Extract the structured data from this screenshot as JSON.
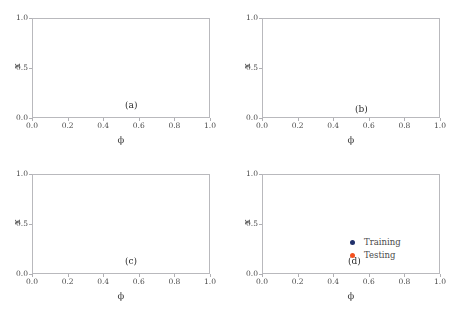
{
  "figure": {
    "background": "#ffffff",
    "axis_color": "#b9b9bd",
    "text_color": "#4a4a4a"
  },
  "legend": {
    "position": "panel-d-lower-right",
    "entries": [
      {
        "label": "Training",
        "color": "#20306b",
        "marker": "circle"
      },
      {
        "label": "Testing",
        "color": "#f4511e",
        "marker": "circle"
      }
    ]
  },
  "axes_common": {
    "xlabel": "ϕ",
    "ylabel": "x",
    "xticks": [
      "0.0",
      "0.2",
      "0.4",
      "0.6",
      "0.8",
      "1.0"
    ],
    "xtick_values": [
      0.0,
      0.2,
      0.4,
      0.6,
      0.8,
      1.0
    ],
    "yticks": [
      "0.0",
      "0.5",
      "1.0"
    ],
    "ytick_values": [
      0.0,
      0.5,
      1.0
    ],
    "xlim": [
      0.0,
      1.0
    ],
    "ylim": [
      0.0,
      1.0
    ],
    "grid": false
  },
  "chart_data": [
    {
      "type": "scatter",
      "panel": "(a)",
      "title": "",
      "xlabel": "ϕ",
      "ylabel": "x",
      "xlim": [
        0.0,
        1.0
      ],
      "ylim": [
        0.0,
        1.0
      ],
      "grid": false,
      "description": "Chaotic band bounded above by a gently undulating ceiling near x=0.87 and below by a wavy floor oscillating between x=0.17 and x=0.47, with embedded lighter voids (islands) arranged in diagonal streaks.",
      "series": [
        {
          "name": "Training",
          "color": "#20306b",
          "n_points": 9000,
          "marker_size": 0.85
        },
        {
          "name": "Testing",
          "color": "#f4511e",
          "n_points": 9000,
          "marker_size": 0.85
        }
      ],
      "band": {
        "upper": [
          0.86,
          0.87,
          0.88,
          0.885,
          0.88,
          0.87,
          0.865,
          0.87,
          0.875,
          0.88,
          0.875,
          0.865,
          0.86,
          0.858,
          0.862,
          0.868,
          0.872,
          0.87,
          0.866,
          0.862,
          0.86
        ],
        "lower": [
          0.31,
          0.285,
          0.26,
          0.235,
          0.215,
          0.205,
          0.205,
          0.22,
          0.255,
          0.3,
          0.345,
          0.39,
          0.425,
          0.452,
          0.468,
          0.47,
          0.455,
          0.425,
          0.385,
          0.345,
          0.31
        ]
      },
      "voids": [
        {
          "cx": 0.1,
          "cy": 0.6,
          "rx": 0.045,
          "ry": 0.17,
          "tilt": -0.22
        },
        {
          "cx": 0.21,
          "cy": 0.61,
          "rx": 0.04,
          "ry": 0.16,
          "tilt": -0.22
        },
        {
          "cx": 0.33,
          "cy": 0.63,
          "rx": 0.04,
          "ry": 0.15,
          "tilt": -0.2
        },
        {
          "cx": 0.45,
          "cy": 0.66,
          "rx": 0.036,
          "ry": 0.13,
          "tilt": -0.18
        },
        {
          "cx": 0.57,
          "cy": 0.68,
          "rx": 0.034,
          "ry": 0.12,
          "tilt": -0.15
        },
        {
          "cx": 0.69,
          "cy": 0.7,
          "rx": 0.03,
          "ry": 0.1,
          "tilt": -0.12
        },
        {
          "cx": 0.8,
          "cy": 0.71,
          "rx": 0.028,
          "ry": 0.09,
          "tilt": -0.1
        },
        {
          "cx": 0.91,
          "cy": 0.7,
          "rx": 0.03,
          "ry": 0.1,
          "tilt": -0.12
        }
      ]
    },
    {
      "type": "scatter",
      "panel": "(b)",
      "title": "",
      "xlabel": "ϕ",
      "ylabel": "x",
      "xlim": [
        0.0,
        1.0
      ],
      "ylim": [
        0.0,
        1.0
      ],
      "grid": false,
      "description": "Large chaotic sea filling almost the entire unit square, capped at x=0.97 and floored by scalloped arcs dipping to x=0.04; contains a large lighter island centered near (0.27,0.42) and a smaller one near (0.83,0.13).",
      "series": [
        {
          "name": "Training",
          "color": "#20306b",
          "n_points": 14000,
          "marker_size": 0.8
        },
        {
          "name": "Testing",
          "color": "#f4511e",
          "n_points": 14000,
          "marker_size": 0.8
        }
      ],
      "band": {
        "upper": [
          0.965,
          0.968,
          0.97,
          0.972,
          0.973,
          0.972,
          0.97,
          0.968,
          0.966,
          0.965,
          0.966,
          0.968,
          0.97,
          0.972,
          0.973,
          0.972,
          0.97,
          0.968,
          0.966,
          0.965,
          0.965
        ],
        "lower": [
          0.115,
          0.095,
          0.085,
          0.09,
          0.105,
          0.125,
          0.135,
          0.13,
          0.11,
          0.075,
          0.045,
          0.055,
          0.095,
          0.135,
          0.155,
          0.15,
          0.125,
          0.09,
          0.06,
          0.055,
          0.085
        ]
      },
      "voids": [
        {
          "cx": 0.275,
          "cy": 0.42,
          "rx": 0.135,
          "ry": 0.155,
          "tilt": 0.1
        },
        {
          "cx": 0.835,
          "cy": 0.135,
          "rx": 0.085,
          "ry": 0.075,
          "tilt": 0.0
        },
        {
          "cx": 0.49,
          "cy": 0.055,
          "rx": 0.03,
          "ry": 0.03,
          "tilt": 0.0
        }
      ]
    },
    {
      "type": "scatter",
      "panel": "(c)",
      "title": "",
      "xlabel": "ϕ",
      "ylabel": "x",
      "xlim": [
        0.0,
        1.0
      ],
      "ylim": [
        0.0,
        1.0
      ],
      "grid": false,
      "description": "Narrow sawtooth filament band with deep V-shaped troughs reaching x=0.02 near phi=0.10, 0.23, 0.47, 0.72 and 0.86, and a tall sharp peak reaching x=1.0 near phi=0.58-0.62.",
      "series": [
        {
          "name": "Training",
          "color": "#20306b",
          "n_points": 7000,
          "marker_size": 0.8
        },
        {
          "name": "Testing",
          "color": "#f4511e",
          "n_points": 7000,
          "marker_size": 0.8
        }
      ],
      "curve": [
        0.52,
        0.53,
        0.5,
        0.22,
        0.06,
        0.33,
        0.5,
        0.5,
        0.28,
        0.05,
        0.07,
        0.45,
        0.68,
        0.72,
        0.55,
        0.3,
        0.06,
        0.4,
        0.78,
        0.95,
        1.0,
        0.96,
        0.7,
        0.4,
        0.14,
        0.05,
        0.22,
        0.45,
        0.55,
        0.4,
        0.12,
        0.03,
        0.18,
        0.45,
        0.62,
        0.66,
        0.6,
        0.52,
        0.48,
        0.5,
        0.55
      ],
      "thickness": [
        0.1,
        0.1,
        0.1,
        0.09,
        0.08,
        0.09,
        0.1,
        0.1,
        0.09,
        0.07,
        0.07,
        0.09,
        0.1,
        0.1,
        0.1,
        0.09,
        0.07,
        0.09,
        0.1,
        0.1,
        0.1,
        0.1,
        0.1,
        0.09,
        0.08,
        0.07,
        0.09,
        0.1,
        0.1,
        0.09,
        0.08,
        0.06,
        0.08,
        0.1,
        0.1,
        0.1,
        0.1,
        0.09,
        0.09,
        0.09,
        0.1
      ]
    },
    {
      "type": "scatter",
      "panel": "(d)",
      "title": "",
      "xlabel": "ϕ",
      "ylabel": "x",
      "xlim": [
        0.0,
        1.0
      ],
      "ylim": [
        0.0,
        1.0
      ],
      "grid": false,
      "description": "Thin smooth wavy filament band: starts near x=0.55, dips to a broad minimum x=0.13 near phi=0.25, rises to a broad maximum x=0.90 around phi=0.62-0.68, then falls to x=0.38 near phi=0.88 and rises again at the right edge.",
      "series": [
        {
          "name": "Training",
          "color": "#20306b",
          "n_points": 6000,
          "marker_size": 0.8
        },
        {
          "name": "Testing",
          "color": "#f4511e",
          "n_points": 6000,
          "marker_size": 0.8
        }
      ],
      "curve": [
        0.56,
        0.52,
        0.46,
        0.42,
        0.44,
        0.4,
        0.33,
        0.25,
        0.18,
        0.14,
        0.13,
        0.15,
        0.22,
        0.34,
        0.46,
        0.44,
        0.48,
        0.58,
        0.68,
        0.75,
        0.8,
        0.83,
        0.86,
        0.84,
        0.87,
        0.89,
        0.9,
        0.89,
        0.86,
        0.82,
        0.76,
        0.68,
        0.6,
        0.52,
        0.44,
        0.4,
        0.44,
        0.52,
        0.58,
        0.54,
        0.47
      ],
      "thickness": [
        0.075,
        0.075,
        0.07,
        0.065,
        0.065,
        0.065,
        0.065,
        0.065,
        0.06,
        0.055,
        0.055,
        0.055,
        0.06,
        0.065,
        0.07,
        0.065,
        0.065,
        0.07,
        0.07,
        0.07,
        0.07,
        0.07,
        0.068,
        0.065,
        0.065,
        0.065,
        0.065,
        0.065,
        0.065,
        0.068,
        0.07,
        0.07,
        0.07,
        0.068,
        0.065,
        0.062,
        0.065,
        0.068,
        0.07,
        0.068,
        0.065
      ]
    }
  ]
}
